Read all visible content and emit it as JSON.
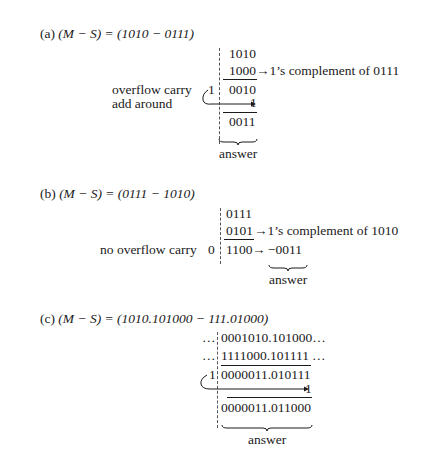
{
  "part_a": {
    "label": "(a)",
    "equation": "(M − S) = (1010 − 0111)",
    "minuend": "1010",
    "complement": "1000",
    "complement_note": "→1’s complement of 0111",
    "carry_digit": "1",
    "partial_sum": "0010",
    "carry_label_1": "overflow carry",
    "carry_label_2": "add around",
    "added_one": "1",
    "result": "0011",
    "answer_label": "answer"
  },
  "part_b": {
    "label": "(b)",
    "equation": "(M − S) = (0111 − 1010)",
    "minuend": "0111",
    "complement": "0101",
    "complement_note": "→1’s complement of 1010",
    "carry_label": "no overflow carry",
    "carry_digit": "0",
    "sum": "1100",
    "arrow": "→",
    "result": "−0011",
    "answer_label": "answer"
  },
  "part_c": {
    "label": "(c)",
    "equation": "(M − S) = (1010.101000 − 111.01000)",
    "row1_prefix": "…",
    "row1": "0001010.101000…",
    "row2_prefix": "…",
    "row2": "1111000.101111",
    "row2_suffix": "…",
    "carry_digit": "1",
    "partial_sum": "0000011.010111",
    "added_one": "1",
    "result": "0000011.011000",
    "answer_label": "answer"
  }
}
